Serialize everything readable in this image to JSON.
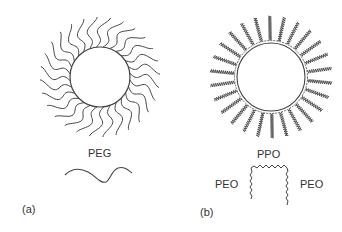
{
  "panels": [
    {
      "id": "a",
      "panel_label": "(a)",
      "polymer_label": "PEG",
      "circle": {
        "cx": 100,
        "cy": 77,
        "r": 30
      },
      "chain_count": 28,
      "chain_style": "smooth-wavy"
    },
    {
      "id": "b",
      "panel_label": "(b)",
      "center_label": "PPO",
      "left_label": "PEO",
      "right_label": "PEO",
      "circle": {
        "cx": 271,
        "cy": 77,
        "r": 34
      },
      "chain_count": 26,
      "chain_style": "jagged"
    }
  ],
  "colors": {
    "line": "#444444",
    "text": "#333333",
    "background": "#ffffff"
  }
}
